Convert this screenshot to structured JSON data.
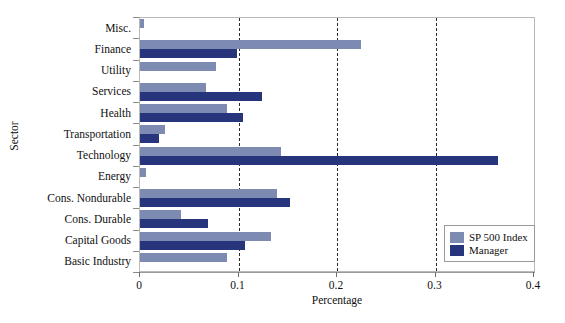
{
  "chart_data": {
    "type": "bar",
    "orientation": "horizontal",
    "title": "",
    "xlabel": "Percentage",
    "ylabel": "Sector",
    "xlim": [
      0,
      0.4
    ],
    "xticks": [
      "0",
      "0.1",
      "0.2",
      "0.3",
      "0.4"
    ],
    "xtick_values": [
      0,
      0.1,
      0.2,
      0.3,
      0.4
    ],
    "grid": "vertical-dashed-at-0.1-0.2-0.3",
    "legend_position": "bottom-right",
    "categories": [
      "Misc.",
      "Finance",
      "Utility",
      "Services",
      "Health",
      "Transportation",
      "Technology",
      "Energy",
      "Cons. Nondurable",
      "Cons. Durable",
      "Capital Goods",
      "Basic Industry"
    ],
    "series": [
      {
        "name": "SP 500 Index",
        "color": "#7d8ab2",
        "values": [
          0.004,
          0.224,
          0.077,
          0.067,
          0.088,
          0.025,
          0.143,
          0.006,
          0.139,
          0.042,
          0.133,
          0.088
        ]
      },
      {
        "name": "Manager",
        "color": "#27357c",
        "values": [
          0.0,
          0.098,
          0.0,
          0.124,
          0.105,
          0.019,
          0.363,
          0.0,
          0.152,
          0.069,
          0.107,
          0.0
        ]
      }
    ]
  },
  "legend": {
    "items": [
      {
        "label": "SP 500 Index",
        "swatch": "sp"
      },
      {
        "label": "Manager",
        "swatch": "mgr"
      }
    ]
  }
}
